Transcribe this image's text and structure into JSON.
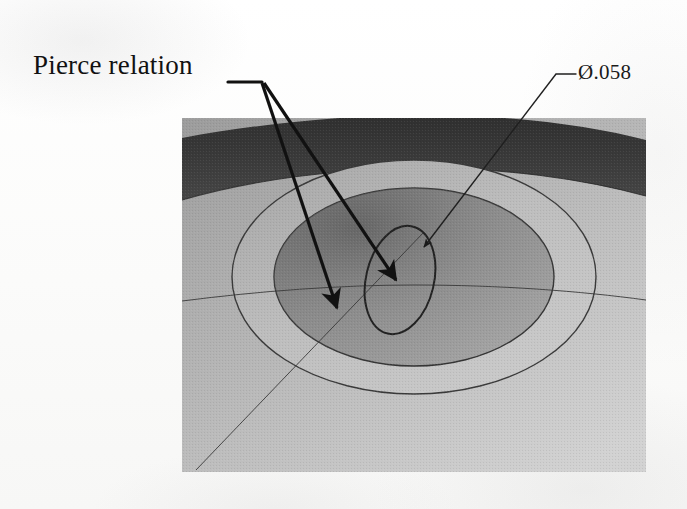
{
  "figure": {
    "kind": "cad-illustration",
    "caption_labels": {
      "pierce": "Pierce relation",
      "diameter": "Ø.058"
    },
    "annotations": [
      {
        "name": "pierce-relation-callout",
        "text": "Pierce relation",
        "leader_jog": {
          "from_x": 230,
          "to_x": 261,
          "y": 82
        },
        "branch_point": {
          "x": 261,
          "y": 82
        },
        "arrows": [
          {
            "name": "pierce-arrow-left",
            "tip_x": 337,
            "tip_y": 309,
            "target": "sketch-line-intersection"
          },
          {
            "name": "pierce-arrow-right",
            "tip_x": 396,
            "tip_y": 281,
            "target": "small-circle-center"
          }
        ]
      },
      {
        "name": "diameter-dimension-callout",
        "text": "Ø.058",
        "leader_jog": {
          "from_x": 575,
          "to_x": 556,
          "y": 74
        },
        "arrow": {
          "name": "diameter-arrow",
          "tip_x": 424,
          "tip_y": 246,
          "target": "small-circle-edge"
        }
      }
    ],
    "geometry": {
      "panel": {
        "x": 182,
        "y": 123,
        "width": 464,
        "height": 349
      },
      "outer_band_label": "cylindrical-outer-face",
      "counterbore_ring_label": "counterbore-shelf",
      "bore_label": "through-bore",
      "small_circle_label": "pierce-sketch-circle",
      "sketch_lines": [
        "horizontal-silhouette-line",
        "diagonal-sketch-line"
      ]
    },
    "colors": {
      "panel_dark_band": "#3a3a3a",
      "panel_mid": "#9a9a9a",
      "panel_light": "#c6c6c6",
      "shelf_ring": "#b4b4b4",
      "bore_shade": "#8a8a8a",
      "line_ink": "#2b2b2b",
      "text_ink": "#111111",
      "paper": "#fdfdfc"
    }
  }
}
